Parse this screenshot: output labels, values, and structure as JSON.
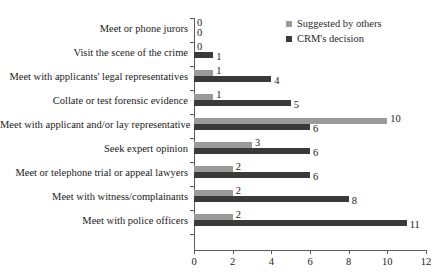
{
  "chart_data": {
    "type": "bar",
    "orientation": "horizontal",
    "title": "",
    "xlabel": "",
    "ylabel": "",
    "xlim": [
      0,
      12
    ],
    "xticks": [
      0,
      2,
      4,
      6,
      8,
      10,
      12
    ],
    "grid": false,
    "legend_position": "top-right",
    "categories": [
      "Meet or phone jurors",
      "Visit the scene of the crime",
      "Meet with applicants' legal representatives",
      "Collate or test forensic evidence",
      "Meet with applicant and/or lay representative",
      "Seek expert opinion",
      "Meet or telephone trial or appeal lawyers",
      "Meet with witness/complainants",
      "Meet with police officers"
    ],
    "series": [
      {
        "name": "Suggested by others",
        "color": "#9a9a9a",
        "values": [
          0,
          0,
          1,
          1,
          10,
          3,
          2,
          2,
          2
        ]
      },
      {
        "name": "CRM's decision",
        "color": "#3a3a3a",
        "values": [
          0,
          1,
          4,
          5,
          6,
          6,
          6,
          8,
          11
        ]
      }
    ]
  },
  "legend": {
    "items": [
      {
        "label": "Suggested by others",
        "color": "#9a9a9a",
        "marker": "square-marker-icon"
      },
      {
        "label": "CRM's decision",
        "color": "#3a3a3a",
        "marker": "square-marker-icon"
      }
    ]
  },
  "axis": {
    "tick_labels": [
      "0",
      "2",
      "4",
      "6",
      "8",
      "10",
      "12"
    ]
  }
}
